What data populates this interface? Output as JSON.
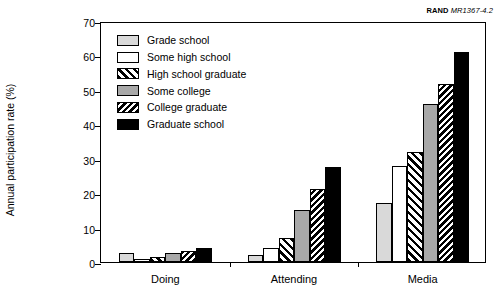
{
  "source_label": {
    "org": "RAND",
    "document": "MR1367-4.2"
  },
  "chart_data": {
    "type": "bar",
    "title": "",
    "xlabel": "",
    "ylabel": "Annual participation rate (%)",
    "ylim": [
      0,
      70
    ],
    "yticks": [
      0,
      10,
      20,
      30,
      40,
      50,
      60,
      70
    ],
    "ytick_labels": [
      "0",
      "10",
      "20",
      "30",
      "40",
      "50",
      "60",
      "70"
    ],
    "grid": false,
    "legend_position": "upper-left-inside",
    "categories": [
      "Doing",
      "Attending",
      "Media"
    ],
    "series": [
      {
        "name": "Grade school",
        "fill": "lightgray",
        "values": [
          2.5,
          2.0,
          17.0
        ]
      },
      {
        "name": "Some high school",
        "fill": "white",
        "values": [
          0.8,
          4.0,
          28.0
        ]
      },
      {
        "name": "High school graduate",
        "fill": "hatch-fwd",
        "values": [
          1.6,
          7.0,
          32.0
        ]
      },
      {
        "name": "Some college",
        "fill": "midgray",
        "values": [
          2.6,
          15.2,
          46.0
        ]
      },
      {
        "name": "College graduate",
        "fill": "hatch-dense",
        "values": [
          3.2,
          21.3,
          51.8
        ]
      },
      {
        "name": "Graduate school",
        "fill": "black",
        "values": [
          4.2,
          27.5,
          61.0
        ]
      }
    ]
  }
}
